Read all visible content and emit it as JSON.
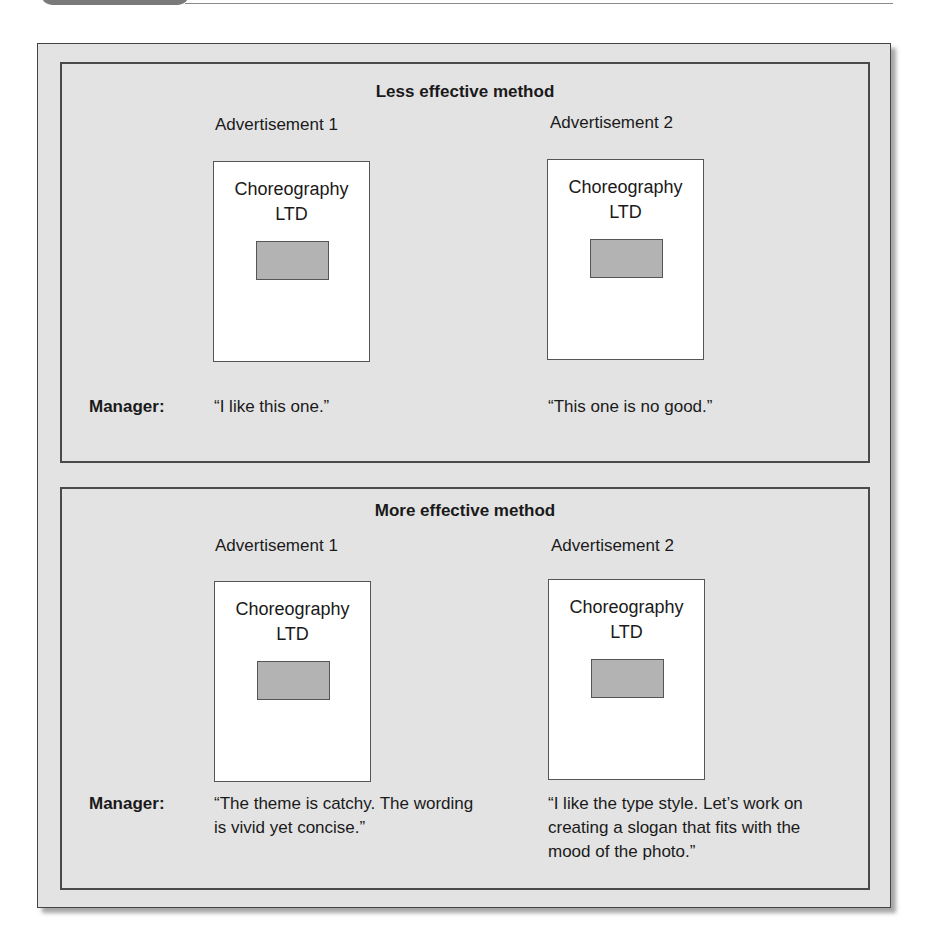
{
  "panels": [
    {
      "title": "Less effective method",
      "ads": [
        {
          "label": "Advertisement 1",
          "company_line1": "Choreography",
          "company_line2": "LTD"
        },
        {
          "label": "Advertisement 2",
          "company_line1": "Choreography",
          "company_line2": "LTD"
        }
      ],
      "manager_label": "Manager:",
      "comments": [
        "“I like this one.”",
        "“This one is no good.”"
      ]
    },
    {
      "title": "More effective method",
      "ads": [
        {
          "label": "Advertisement 1",
          "company_line1": "Choreography",
          "company_line2": "LTD"
        },
        {
          "label": "Advertisement 2",
          "company_line1": "Choreography",
          "company_line2": "LTD"
        }
      ],
      "manager_label": "Manager:",
      "comments": [
        "“The theme is catchy. The wording is vivid yet concise.”",
        "“I like the type style. Let’s work on creating a slogan that fits with the mood of the photo.”"
      ]
    }
  ],
  "colors": {
    "panel_bg": "#e3e3e3",
    "photo_placeholder": "#b3b3b3",
    "border": "#4a4a4a"
  }
}
